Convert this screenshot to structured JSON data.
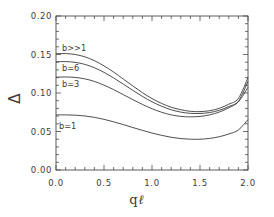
{
  "chart_data": {
    "type": "line",
    "title": "",
    "xlabel": "q ℓ",
    "ylabel": "Δ",
    "xlim": [
      0.0,
      2.0
    ],
    "ylim": [
      0.0,
      0.2
    ],
    "xticks": [
      "0.0",
      "0.5",
      "1.0",
      "1.5",
      "2.0"
    ],
    "xtick_values": [
      0.0,
      0.5,
      1.0,
      1.5,
      2.0
    ],
    "yticks": [
      "0.00",
      "0.05",
      "0.10",
      "0.15",
      "0.20"
    ],
    "ytick_values": [
      0.0,
      0.05,
      0.1,
      0.15,
      0.2
    ],
    "grid": false,
    "legend_position": "inline-annotations",
    "minor_ticks": true,
    "tick_direction": "in",
    "x": [
      0.0,
      0.1,
      0.2,
      0.3,
      0.4,
      0.5,
      0.6,
      0.7,
      0.8,
      0.9,
      1.0,
      1.1,
      1.2,
      1.3,
      1.4,
      1.5,
      1.6,
      1.7,
      1.8,
      1.9,
      2.0
    ],
    "series": [
      {
        "name": "b>>1",
        "label": "b>>1",
        "color": "#3a3a3a",
        "values": [
          0.151,
          0.1512,
          0.15,
          0.147,
          0.142,
          0.1352,
          0.1272,
          0.1182,
          0.1092,
          0.1005,
          0.0928,
          0.0865,
          0.0815,
          0.0783,
          0.0762,
          0.0758,
          0.077,
          0.08,
          0.0855,
          0.093,
          0.12
        ]
      },
      {
        "name": "b=6",
        "label": "b=6",
        "color": "#3a3a3a",
        "values": [
          0.1405,
          0.1408,
          0.1398,
          0.1372,
          0.1328,
          0.1268,
          0.1196,
          0.1116,
          0.1034,
          0.0956,
          0.0886,
          0.0828,
          0.0782,
          0.0752,
          0.0736,
          0.0734,
          0.0746,
          0.0775,
          0.0825,
          0.0895,
          0.115
        ]
      },
      {
        "name": "b=3",
        "label": "b=3",
        "color": "#3a3a3a",
        "values": [
          0.1205,
          0.1208,
          0.1202,
          0.1184,
          0.115,
          0.1102,
          0.1044,
          0.098,
          0.0914,
          0.0852,
          0.0796,
          0.075,
          0.0716,
          0.0696,
          0.069,
          0.0696,
          0.0716,
          0.0752,
          0.0808,
          0.0885,
          0.1075
        ]
      },
      {
        "name": "b=1",
        "label": "b=1",
        "color": "#3a3a3a",
        "values": [
          0.0715,
          0.0716,
          0.0712,
          0.0702,
          0.0684,
          0.0658,
          0.0626,
          0.059,
          0.0552,
          0.0515,
          0.048,
          0.045,
          0.0425,
          0.0408,
          0.04,
          0.04,
          0.041,
          0.0432,
          0.0468,
          0.052,
          0.0655
        ]
      }
    ],
    "annotations": [
      {
        "text": "b>>1",
        "x_px": 62,
        "y_px": 51
      },
      {
        "text": "b=6",
        "x_px": 62,
        "y_px": 71
      },
      {
        "text": "b=3",
        "x_px": 62,
        "y_px": 87
      },
      {
        "text": "b=1",
        "x_px": 59,
        "y_px": 129
      }
    ]
  },
  "axes": {
    "ylabel": "Δ",
    "xlabel_prefix": "q",
    "xlabel_symbol": "ℓ"
  }
}
